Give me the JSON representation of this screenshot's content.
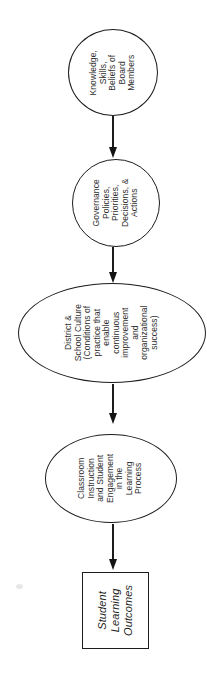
{
  "diagram": {
    "type": "flowchart",
    "direction": "top-to-bottom",
    "text_rotation_deg": -90,
    "colors": {
      "stroke": "#1c1c1c",
      "text": "#2e2e2e",
      "background": "#ffffff"
    },
    "nodes": [
      {
        "id": "board-knowledge",
        "shape": "circle",
        "text": "Knowledge,\nSkills,\nBeliefs of\nBoard\nMembers"
      },
      {
        "id": "governance-policies",
        "shape": "circle",
        "text": "Governance\nPolicies,\nPriorities,\nDecisions, &\nActions"
      },
      {
        "id": "district-school-culture",
        "shape": "ellipse",
        "text": "District &\nSchool Culture\n(Conditions of\npractice that\nenable\ncontinuous\nimprovement\nand\norganizational\nsuccess)"
      },
      {
        "id": "classroom-instruction",
        "shape": "ellipse",
        "text": "Classroom\nInstruction\nand Student\nEngagement\nin the\nLearning\nProcess"
      },
      {
        "id": "student-learning-outcomes",
        "shape": "rect",
        "text": "Student\nLearning\nOutcomes"
      }
    ],
    "connectors": [
      {
        "from": "board-knowledge",
        "to": "governance-policies",
        "style": "arrow-down"
      },
      {
        "from": "governance-policies",
        "to": "district-school-culture",
        "style": "arrow-down"
      },
      {
        "from": "district-school-culture",
        "to": "classroom-instruction",
        "style": "arrow-down"
      },
      {
        "from": "classroom-instruction",
        "to": "student-learning-outcomes",
        "style": "arrow-down"
      }
    ]
  }
}
